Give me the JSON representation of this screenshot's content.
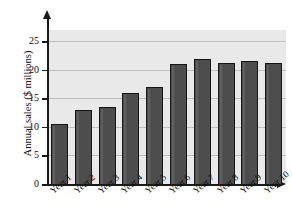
{
  "chart_data": {
    "type": "bar",
    "title": "",
    "xlabel": "",
    "ylabel": "Annual sales ($ millions)",
    "categories": [
      "Year 1",
      "Year 2",
      "Year 3",
      "Year 4",
      "Year 5",
      "Year 6",
      "Year 7",
      "Year 8",
      "Year 9",
      "Year 10"
    ],
    "values": [
      10.5,
      13.0,
      13.5,
      16.0,
      17.0,
      21.0,
      22.0,
      21.2,
      21.5,
      21.3
    ],
    "ylim": [
      0,
      27
    ],
    "yticks": [
      0,
      5,
      10,
      15,
      20,
      25
    ],
    "ytick_labels": [
      "0",
      "5",
      "10",
      "15",
      "20",
      "25"
    ],
    "grid": true,
    "grid_axis": "y",
    "legend": false,
    "legend_position": "none",
    "bar_color": "#4d4d4d",
    "bar_edge_color": "#151515",
    "plot_background": "#e9e9e9",
    "gridline_color": "#bfbfbf",
    "axis_color": "#1a1a1a",
    "axis_style": "arrow",
    "xlabel_rotation": -40
  }
}
